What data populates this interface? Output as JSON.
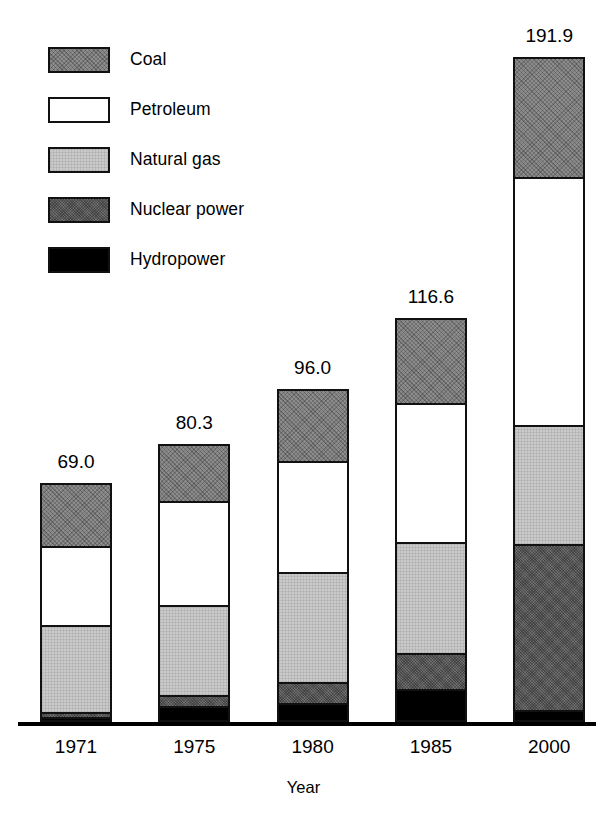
{
  "chart_data": {
    "type": "bar",
    "subtype": "stacked-bar",
    "title": "",
    "xlabel": "Year",
    "ylabel": "",
    "grid": false,
    "legend_position": "top-left",
    "axis_visible": {
      "x_axis_line": true,
      "y_axis": false
    },
    "categories": [
      "1971",
      "1975",
      "1980",
      "1985",
      "2000"
    ],
    "totals": [
      69.0,
      80.3,
      96.0,
      116.6,
      191.9
    ],
    "total_labels": [
      "69.0",
      "80.3",
      "96.0",
      "116.6",
      "191.9"
    ],
    "stack_order_top_to_bottom": [
      "Coal",
      "Petroleum",
      "Natural gas",
      "Nuclear power",
      "Hydropower"
    ],
    "series": [
      {
        "name": "Coal",
        "color": "#8c8c8c",
        "pattern": "cross-hatch",
        "values": [
          17.5,
          16.0,
          20.0,
          24.0,
          34.0
        ]
      },
      {
        "name": "Petroleum",
        "color": "#ffffff",
        "pattern": "solid",
        "values": [
          23.0,
          30.0,
          32.0,
          40.0,
          71.5
        ]
      },
      {
        "name": "Natural gas",
        "color": "#c9c9c9",
        "pattern": "fine-grid",
        "values": [
          25.0,
          26.0,
          32.0,
          32.0,
          34.5
        ]
      },
      {
        "name": "Nuclear power",
        "color": "#6e6e6e",
        "pattern": "dense-hatch",
        "values": [
          1.5,
          3.0,
          6.0,
          10.5,
          48.0
        ]
      },
      {
        "name": "Hydropower",
        "color": "#000000",
        "pattern": "solid",
        "values": [
          2.0,
          5.3,
          6.0,
          10.1,
          3.9
        ]
      }
    ],
    "ylim": [
      0,
      191.9
    ]
  },
  "legend": {
    "items": [
      {
        "label": "Coal"
      },
      {
        "label": "Petroleum"
      },
      {
        "label": "Natural gas"
      },
      {
        "label": "Nuclear power"
      },
      {
        "label": "Hydropower"
      }
    ]
  },
  "axis": {
    "x_title": "Year",
    "tick_labels": [
      "1971",
      "1975",
      "1980",
      "1985",
      "2000"
    ]
  }
}
